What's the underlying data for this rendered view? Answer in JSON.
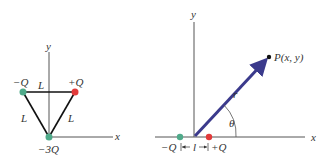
{
  "left_diagram": {
    "axes": {
      "x_label": "x",
      "y_label": "y"
    },
    "charges": [
      {
        "label": "−Q",
        "color": "#4faa8a",
        "position": "top-left"
      },
      {
        "label": "+Q",
        "color": "#e23a3a",
        "position": "top-right"
      },
      {
        "label": "−3Q",
        "color": "#4faa8a",
        "position": "bottom-origin"
      }
    ],
    "side_labels": {
      "top": "L",
      "left": "L",
      "right": "L"
    }
  },
  "right_diagram": {
    "axes": {
      "x_label": "x",
      "y_label": "y"
    },
    "charges": [
      {
        "label": "−Q",
        "color": "#4faa8a"
      },
      {
        "label": "+Q",
        "color": "#e23a3a"
      }
    ],
    "spacing_label": "l",
    "vector_label": "r",
    "angle_label": "θ",
    "point_label": "P(x, y)",
    "vector_color": "#3b3a8c"
  }
}
